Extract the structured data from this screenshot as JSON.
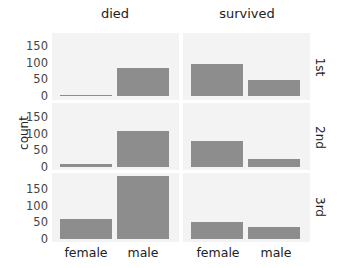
{
  "chart_data": {
    "type": "bar",
    "facets": {
      "columns": [
        "died",
        "survived"
      ],
      "rows": [
        "1st",
        "2nd",
        "3rd"
      ]
    },
    "categories": [
      "female",
      "male"
    ],
    "xlabel": "",
    "ylabel": "count",
    "yticks": [
      0,
      50,
      100,
      150
    ],
    "ylim": [
      -8,
      190
    ],
    "grid": false,
    "panels": [
      {
        "row": "1st",
        "col": "died",
        "values": [
          4,
          84
        ]
      },
      {
        "row": "1st",
        "col": "survived",
        "values": [
          97,
          47
        ]
      },
      {
        "row": "2nd",
        "col": "died",
        "values": [
          9,
          108
        ]
      },
      {
        "row": "2nd",
        "col": "survived",
        "values": [
          78,
          24
        ]
      },
      {
        "row": "3rd",
        "col": "died",
        "values": [
          60,
          189
        ]
      },
      {
        "row": "3rd",
        "col": "survived",
        "values": [
          51,
          36
        ]
      }
    ],
    "colors": {
      "bar": "#8d8d8d",
      "panel_bg": "#f3f3f3"
    }
  },
  "labels": {
    "col0": "died",
    "col1": "survived",
    "row0": "1st",
    "row1": "2nd",
    "row2": "3rd",
    "ylabel": "count",
    "x0": "female",
    "x1": "male",
    "ticks": [
      "0",
      "50",
      "100",
      "150"
    ]
  }
}
